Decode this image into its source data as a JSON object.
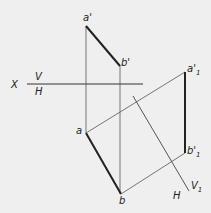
{
  "diagram": {
    "type": "descriptive-geometry-projection",
    "labels": {
      "a_prime": "a'",
      "b_prime": "b'",
      "a": "a",
      "b": "b",
      "a1_prime": "a'",
      "a1_sub": "1",
      "b1_prime": "b'",
      "b1_sub": "1",
      "x_axis": "X",
      "v_plane": "V",
      "h_plane": "H",
      "h_plane_2": "H",
      "v1_plane": "V",
      "v1_sub": "1"
    },
    "colors": {
      "background": "#efefef",
      "line": "#333333"
    }
  }
}
